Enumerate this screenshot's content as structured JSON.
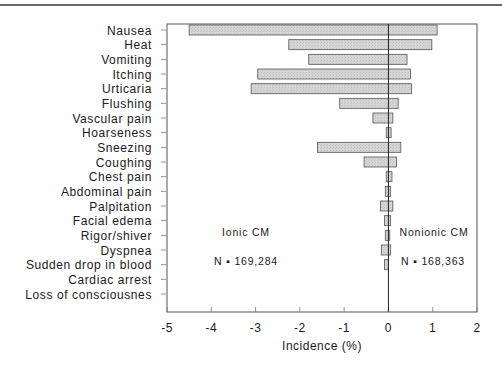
{
  "chart_data": {
    "type": "bar",
    "orientation": "horizontal",
    "title": "",
    "xlabel": "Incidence (%)",
    "ylabel": "",
    "xlim": [
      -5,
      2
    ],
    "xticks": [
      -5,
      -4,
      -3,
      -2,
      -1,
      0,
      1,
      2
    ],
    "xtick_labels": [
      "-5",
      "-4",
      "-3",
      "-2",
      "-1",
      "0",
      "1",
      "2"
    ],
    "grid": false,
    "categories": [
      "Nausea",
      "Heat",
      "Vomiting",
      "Itching",
      "Urticaria",
      "Flushing",
      "Vascular pain",
      "Hoarseness",
      "Sneezing",
      "Coughing",
      "Chest pain",
      "Abdominal pain",
      "Palpitation",
      "Facial edema",
      "Rigor/shiver",
      "Dyspnea",
      "Sudden drop in blood",
      "Cardiac arrest",
      "Loss of consciousnes"
    ],
    "series": [
      {
        "name": "Ionic CM",
        "n": "169,284",
        "values": [
          -4.5,
          -2.25,
          -1.8,
          -2.95,
          -3.1,
          -1.1,
          -0.35,
          -0.05,
          -1.6,
          -0.55,
          -0.05,
          -0.07,
          -0.18,
          -0.09,
          -0.07,
          -0.16,
          -0.09,
          0,
          0
        ]
      },
      {
        "name": "Nonionic CM",
        "n": "168,363",
        "values": [
          1.1,
          0.98,
          0.42,
          0.5,
          0.52,
          0.22,
          0.1,
          0.06,
          0.28,
          0.18,
          0.08,
          0.05,
          0.1,
          0.05,
          0.03,
          0.05,
          0,
          0,
          0
        ]
      }
    ],
    "annotations": [
      "Ionic CM",
      "N ▪ 169,284",
      "Nonionic CM",
      "N ▪ 168,363"
    ],
    "bar_fill": "#d4d4d4",
    "bar_stroke": "#555555"
  },
  "annotations": {
    "ionic_label": "Ionic CM",
    "ionic_n": "N ▪ 169,284",
    "nonionic_label": "Nonionic CM",
    "nonionic_n": "N ▪ 168,363"
  }
}
